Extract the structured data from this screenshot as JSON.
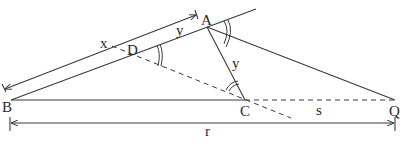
{
  "diagram": {
    "type": "geometry",
    "colors": {
      "stroke": "#3a3a3a",
      "text": "#2a2a2a",
      "background": "#ffffff"
    },
    "points": {
      "A": {
        "label": "A",
        "x": 207,
        "y": 27
      },
      "B": {
        "label": "B",
        "x": 11,
        "y": 100
      },
      "C": {
        "label": "C",
        "x": 245,
        "y": 100
      },
      "D": {
        "label": "D",
        "x": 133,
        "y": 55
      },
      "Q": {
        "label": "Q",
        "x": 395,
        "y": 100
      }
    },
    "segment_labels": {
      "x": "x",
      "y_top": "y",
      "y_ac": "y",
      "s": "s",
      "r": "r"
    },
    "segments": [
      {
        "from": "B",
        "to": "A",
        "style": "solid",
        "extends": true
      },
      {
        "from": "B",
        "to": "C",
        "style": "solid"
      },
      {
        "from": "A",
        "to": "C",
        "style": "solid",
        "label": "y"
      },
      {
        "from": "A",
        "to": "Q",
        "style": "solid"
      },
      {
        "from": "C",
        "to": "Q",
        "style": "dashed",
        "label": "s"
      },
      {
        "from": "D",
        "to": "C",
        "style": "dashed",
        "extends": true
      }
    ],
    "dimensions": [
      {
        "name": "BA-dimension",
        "labels": [
          "x",
          "y"
        ],
        "direction": "parallel to BA"
      },
      {
        "name": "BQ-dimension",
        "label": "r"
      }
    ],
    "angle_marks": [
      {
        "at": "D",
        "arcs": 2
      },
      {
        "at": "A",
        "arcs": 2
      },
      {
        "at": "C",
        "arcs": 2
      }
    ]
  }
}
